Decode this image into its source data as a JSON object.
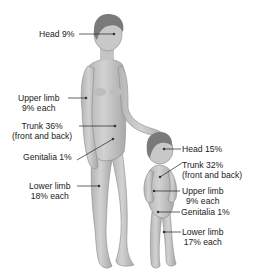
{
  "adult": {
    "labels": [
      {
        "id": "head",
        "line1": "Head 9%",
        "line2": ""
      },
      {
        "id": "upper-limb",
        "line1": "Upper limb",
        "line2": "9% each"
      },
      {
        "id": "trunk",
        "line1": "Trunk 36%",
        "line2": "(front and back)"
      },
      {
        "id": "genitalia",
        "line1": "Genitalia 1%",
        "line2": ""
      },
      {
        "id": "lower-limb",
        "line1": "Lower limb",
        "line2": "18% each"
      }
    ]
  },
  "child": {
    "labels": [
      {
        "id": "head",
        "line1": "Head 15%",
        "line2": ""
      },
      {
        "id": "trunk",
        "line1": "Trunk 32%",
        "line2": "(front and back)"
      },
      {
        "id": "upper-limb",
        "line1": "Upper limb",
        "line2": "9% each"
      },
      {
        "id": "genitalia",
        "line1": "Genitalia 1%",
        "line2": ""
      },
      {
        "id": "lower-limb",
        "line1": "Lower limb",
        "line2": "17% each"
      }
    ]
  },
  "colors": {
    "skin": "#c9c9c9",
    "skin_shade": "#a9a9a9",
    "hair": "#7a7a7a",
    "leader": "#222222"
  }
}
